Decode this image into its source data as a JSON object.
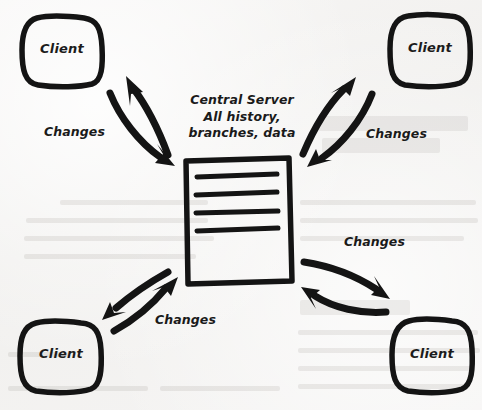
{
  "diagram": {
    "style": "hand-drawn sketch on paper",
    "background_color": "#f4f3f2",
    "ink_color": "#141414",
    "server": {
      "icon": "document-icon",
      "line_count": 4,
      "caption_lines": [
        "Central Server",
        "All history,",
        "branches, data"
      ]
    },
    "clients": [
      {
        "id": "client-top-left",
        "label": "Client",
        "position": "top-left"
      },
      {
        "id": "client-top-right",
        "label": "Client",
        "position": "top-right"
      },
      {
        "id": "client-bottom-left",
        "label": "Client",
        "position": "bottom-left"
      },
      {
        "id": "client-bottom-right",
        "label": "Client",
        "position": "bottom-right"
      }
    ],
    "connections": [
      {
        "id": "conn-top-left",
        "label": "Changes",
        "from": "central-server",
        "to": "client-top-left",
        "direction": "bidirectional"
      },
      {
        "id": "conn-top-right",
        "label": "Changes",
        "from": "central-server",
        "to": "client-top-right",
        "direction": "bidirectional"
      },
      {
        "id": "conn-bottom-left",
        "label": "Changes",
        "from": "central-server",
        "to": "client-bottom-left",
        "direction": "bidirectional"
      },
      {
        "id": "conn-bottom-right",
        "label": "Changes",
        "from": "central-server",
        "to": "client-bottom-right",
        "direction": "bidirectional"
      }
    ]
  }
}
